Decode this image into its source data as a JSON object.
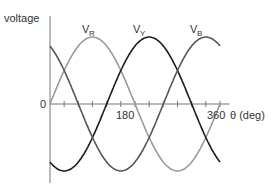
{
  "chart_data": {
    "type": "line",
    "title": "",
    "xlabel": "θ (deg)",
    "ylabel": "voltage",
    "x_ticks": [
      "0",
      "180",
      "360"
    ],
    "x_tick_step_deg": 30,
    "xlim": [
      0,
      380
    ],
    "ylim": [
      -1,
      1
    ],
    "grid": false,
    "series": [
      {
        "name": "V_R",
        "label_main": "V",
        "label_sub": "R",
        "color": "#9a9a9a",
        "phase_deg": 0,
        "formula": "sin(θ)"
      },
      {
        "name": "V_Y",
        "label_main": "V",
        "label_sub": "Y",
        "color": "#1a1a1a",
        "phase_deg": -120,
        "formula": "sin(θ-120)"
      },
      {
        "name": "V_B",
        "label_main": "V",
        "label_sub": "B",
        "color": "#555555",
        "phase_deg": -240,
        "formula": "sin(θ-240)"
      }
    ]
  },
  "labels": {
    "ylabel": "voltage",
    "origin": "0",
    "tick180": "180",
    "tick360": "360",
    "xlabel": "θ (deg)",
    "vr_main": "V",
    "vr_sub": "R",
    "vy_main": "V",
    "vy_sub": "Y",
    "vb_main": "V",
    "vb_sub": "B"
  }
}
